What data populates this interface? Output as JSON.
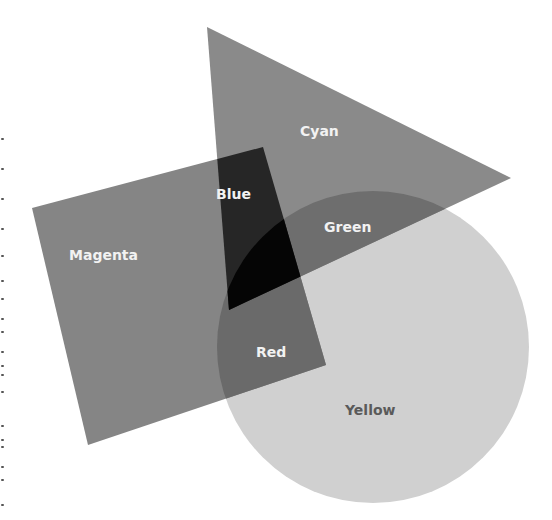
{
  "diagram": {
    "title": "",
    "shapes": [
      {
        "id": "cyan",
        "label": "Cyan",
        "shape": "triangle",
        "fill": "#8a8a8a"
      },
      {
        "id": "magenta",
        "label": "Magenta",
        "shape": "quadrilateral",
        "fill": "#858585"
      },
      {
        "id": "yellow",
        "label": "Yellow",
        "shape": "circle",
        "fill": "#d0d0d0"
      }
    ],
    "overlaps": [
      {
        "id": "blue",
        "label": "Blue",
        "of": [
          "cyan",
          "magenta"
        ],
        "fill": "#262626"
      },
      {
        "id": "green",
        "label": "Green",
        "of": [
          "cyan",
          "yellow"
        ],
        "fill": "#6e6e6e"
      },
      {
        "id": "red",
        "label": "Red",
        "of": [
          "magenta",
          "yellow"
        ],
        "fill": "#6a6a6a"
      },
      {
        "id": "black",
        "label": "",
        "of": [
          "cyan",
          "magenta",
          "yellow"
        ],
        "fill": "#050505"
      }
    ],
    "labels": {
      "cyan": "Cyan",
      "magenta": "Magenta",
      "yellow": "Yellow",
      "blue": "Blue",
      "green": "Green",
      "red": "Red"
    },
    "label_colors": {
      "light": "#f2f2f2",
      "dark": "#5a5a5a"
    }
  }
}
